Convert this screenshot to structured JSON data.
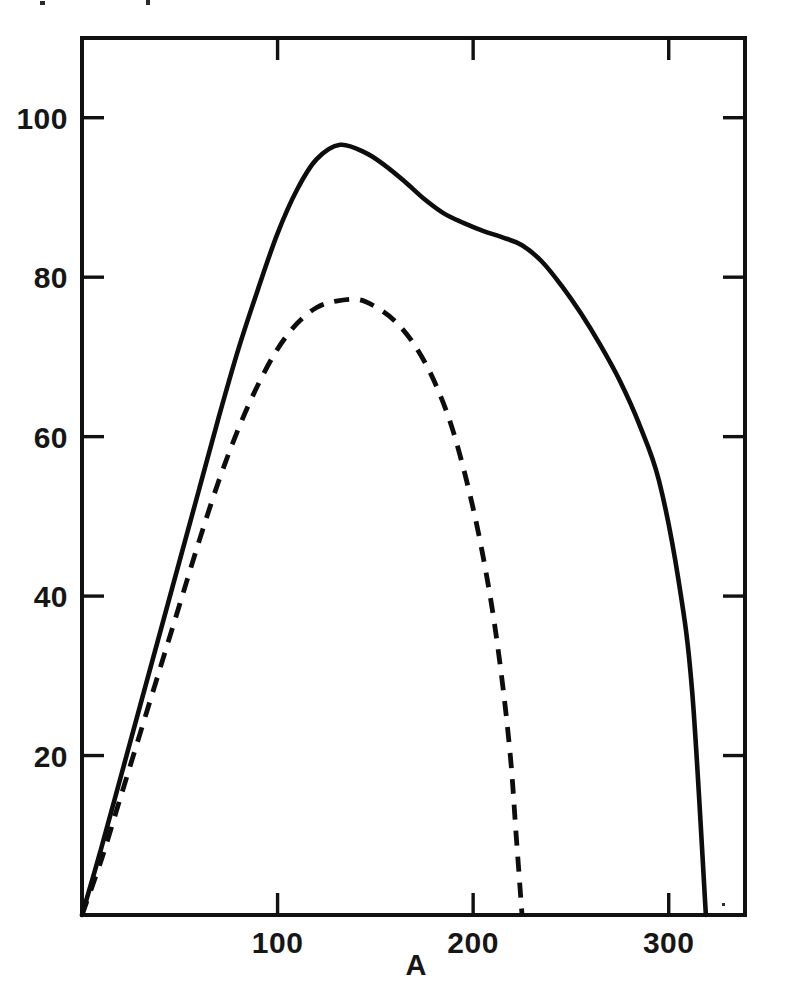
{
  "figure": {
    "background_color": "#ffffff",
    "ink_color": "#111111"
  },
  "axes": {
    "x_label": "A",
    "x_ticks": [
      {
        "value": 100,
        "label": "100"
      },
      {
        "value": 200,
        "label": "200"
      },
      {
        "value": 300,
        "label": "300"
      }
    ],
    "y_ticks": [
      {
        "value": 20,
        "label": "20"
      },
      {
        "value": 40,
        "label": "40"
      },
      {
        "value": 60,
        "label": "60"
      },
      {
        "value": 80,
        "label": "80"
      },
      {
        "value": 100,
        "label": "100"
      }
    ],
    "y_label": ""
  },
  "chart_data": {
    "type": "line",
    "title": "",
    "xlabel": "A",
    "ylabel": "",
    "xlim": [
      0,
      339
    ],
    "ylim": [
      0,
      110
    ],
    "grid": false,
    "legend": "none",
    "tick_direction": "in",
    "ticks_on_all_four_sides": true,
    "series": [
      {
        "name": "solid-curve",
        "style": "solid",
        "color": "#0d0d0d",
        "peak": {
          "x": 132,
          "y": 96.6
        },
        "endpoint_x": 319,
        "points": [
          {
            "x": 0,
            "y": 0
          },
          {
            "x": 10,
            "y": 8.5
          },
          {
            "x": 20,
            "y": 17.5
          },
          {
            "x": 30,
            "y": 26.5
          },
          {
            "x": 40,
            "y": 35.5
          },
          {
            "x": 50,
            "y": 44.5
          },
          {
            "x": 60,
            "y": 53.5
          },
          {
            "x": 70,
            "y": 62.5
          },
          {
            "x": 80,
            "y": 71.0
          },
          {
            "x": 90,
            "y": 78.5
          },
          {
            "x": 100,
            "y": 85.5
          },
          {
            "x": 110,
            "y": 91.0
          },
          {
            "x": 120,
            "y": 94.8
          },
          {
            "x": 132,
            "y": 96.6
          },
          {
            "x": 145,
            "y": 95.6
          },
          {
            "x": 155,
            "y": 94.0
          },
          {
            "x": 165,
            "y": 92.0
          },
          {
            "x": 175,
            "y": 89.8
          },
          {
            "x": 185,
            "y": 88.0
          },
          {
            "x": 195,
            "y": 86.8
          },
          {
            "x": 205,
            "y": 85.8
          },
          {
            "x": 215,
            "y": 85.0
          },
          {
            "x": 225,
            "y": 84.0
          },
          {
            "x": 235,
            "y": 82.0
          },
          {
            "x": 245,
            "y": 79.0
          },
          {
            "x": 255,
            "y": 75.5
          },
          {
            "x": 265,
            "y": 71.5
          },
          {
            "x": 275,
            "y": 67.0
          },
          {
            "x": 285,
            "y": 61.5
          },
          {
            "x": 295,
            "y": 54.5
          },
          {
            "x": 305,
            "y": 42.0
          },
          {
            "x": 312,
            "y": 28.0
          },
          {
            "x": 319,
            "y": 0
          }
        ]
      },
      {
        "name": "dashed-curve",
        "style": "dashed",
        "color": "#0d0d0d",
        "peak": {
          "x": 141,
          "y": 77.2
        },
        "endpoint_x": 225,
        "points": [
          {
            "x": 0,
            "y": 0
          },
          {
            "x": 10,
            "y": 7.0
          },
          {
            "x": 20,
            "y": 15.0
          },
          {
            "x": 30,
            "y": 23.0
          },
          {
            "x": 40,
            "y": 31.0
          },
          {
            "x": 50,
            "y": 39.0
          },
          {
            "x": 60,
            "y": 47.0
          },
          {
            "x": 70,
            "y": 54.5
          },
          {
            "x": 80,
            "y": 61.0
          },
          {
            "x": 90,
            "y": 66.5
          },
          {
            "x": 100,
            "y": 71.0
          },
          {
            "x": 110,
            "y": 74.2
          },
          {
            "x": 120,
            "y": 76.2
          },
          {
            "x": 130,
            "y": 77.0
          },
          {
            "x": 141,
            "y": 77.2
          },
          {
            "x": 150,
            "y": 76.3
          },
          {
            "x": 160,
            "y": 74.5
          },
          {
            "x": 170,
            "y": 71.5
          },
          {
            "x": 180,
            "y": 67.0
          },
          {
            "x": 190,
            "y": 60.5
          },
          {
            "x": 200,
            "y": 51.0
          },
          {
            "x": 208,
            "y": 41.0
          },
          {
            "x": 214,
            "y": 31.0
          },
          {
            "x": 219,
            "y": 20.0
          },
          {
            "x": 222,
            "y": 10.0
          },
          {
            "x": 225,
            "y": 0
          }
        ]
      }
    ]
  }
}
